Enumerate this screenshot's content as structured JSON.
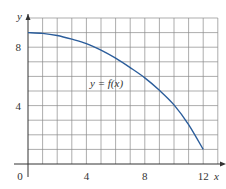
{
  "chart_data": {
    "type": "line",
    "title": "",
    "xlabel": "x",
    "ylabel": "y",
    "xlim": [
      0,
      13
    ],
    "ylim": [
      0,
      10
    ],
    "grid": true,
    "grid_step": 1,
    "x_ticks": [
      0,
      4,
      8,
      12
    ],
    "y_ticks": [
      4,
      8
    ],
    "x_tick_labels": [
      "0",
      "4",
      "8",
      "12"
    ],
    "y_tick_labels": [
      "4",
      "8"
    ],
    "series": [
      {
        "name": "y = f(x)",
        "color": "#2b5d9b",
        "x": [
          0,
          1,
          2,
          3,
          4,
          5,
          6,
          7,
          8,
          9,
          10,
          11,
          12
        ],
        "values": [
          9.0,
          8.95,
          8.8,
          8.55,
          8.25,
          7.8,
          7.25,
          6.6,
          5.9,
          5.05,
          4.05,
          2.7,
          1.0
        ]
      }
    ],
    "annotations": [
      {
        "text": "y = f(x)",
        "x": 5.7,
        "y": 5.5
      }
    ],
    "legend": "none"
  },
  "labels": {
    "origin": "0",
    "x_axis": "x",
    "y_axis": "y",
    "curve": "y = f(x)"
  },
  "colors": {
    "curve": "#2b5d9b",
    "grid": "#8a8a8a",
    "axis": "#333333",
    "background": "#ffffff"
  }
}
